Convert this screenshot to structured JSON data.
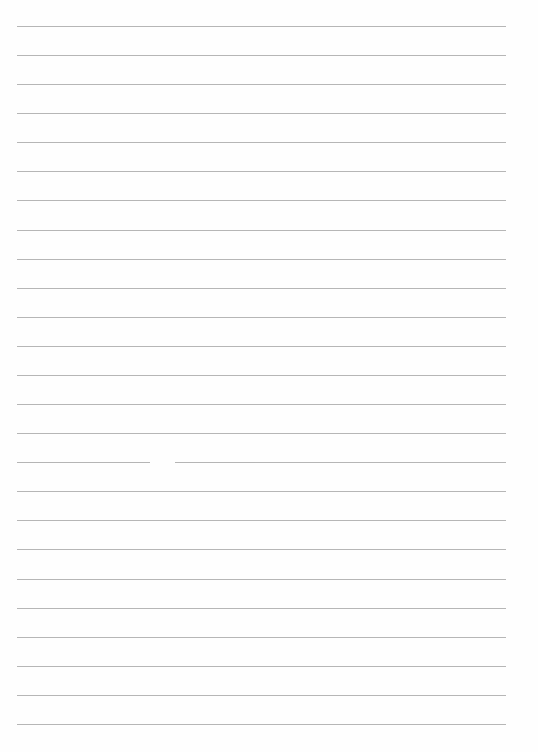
{
  "document": {
    "type": "blank lined paper",
    "line_count": 25,
    "line_color": "#a9a9a9",
    "background_color": "#fefefe",
    "text": ""
  }
}
